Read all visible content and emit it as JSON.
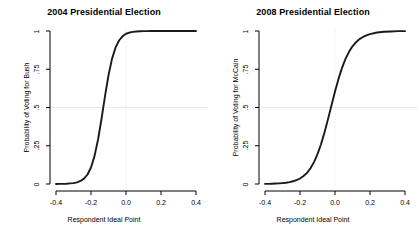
{
  "figure": {
    "width": 417,
    "height": 237,
    "background": "#ffffff",
    "axis_color": "#000000",
    "curve_color": "#1a1a1a",
    "gridline_color": "#e8e8e8"
  },
  "chart_data": [
    {
      "type": "line",
      "title": "2004 Presidential Election",
      "xlabel": "Respondent Ideal Point",
      "ylabel": "Probability of Voting for Bush",
      "xlim": [
        -0.4,
        0.4
      ],
      "ylim": [
        0,
        1
      ],
      "xticks": [
        -0.4,
        -0.2,
        0.0,
        0.2,
        0.4
      ],
      "xtick_labels": [
        "-0.4",
        "-0.2",
        "0.0",
        "0.2",
        "0.4"
      ],
      "yticks": [
        0,
        0.25,
        0.5,
        0.75,
        1
      ],
      "ytick_labels": [
        "0",
        ".25",
        ".5",
        ".75",
        "1"
      ],
      "grid": "reference lines at y=0.5 and x=0.0",
      "reference_lines": {
        "horizontal": 0.5,
        "vertical": 0.0
      },
      "legend": "none",
      "series": [
        {
          "name": "Probability of Voting for Bush",
          "model": "logistic",
          "midpoint": -0.04,
          "slope": 30,
          "x": [
            -0.4,
            -0.38,
            -0.36,
            -0.34,
            -0.32,
            -0.3,
            -0.28,
            -0.26,
            -0.24,
            -0.22,
            -0.2,
            -0.18,
            -0.16,
            -0.14,
            -0.12,
            -0.1,
            -0.08,
            -0.06,
            -0.04,
            -0.02,
            0.0,
            0.02,
            0.04,
            0.06,
            0.08,
            0.1,
            0.12,
            0.14,
            0.16,
            0.18,
            0.2,
            0.24,
            0.28,
            0.32,
            0.36,
            0.4
          ],
          "values": [
            0.0,
            0.001,
            0.001,
            0.002,
            0.004,
            0.006,
            0.011,
            0.02,
            0.035,
            0.062,
            0.108,
            0.182,
            0.289,
            0.425,
            0.574,
            0.711,
            0.818,
            0.891,
            0.938,
            0.965,
            0.982,
            0.99,
            0.994,
            0.997,
            0.998,
            0.999,
            0.999,
            1.0,
            1.0,
            1.0,
            1.0,
            1.0,
            1.0,
            1.0,
            1.0,
            1.0
          ]
        }
      ]
    },
    {
      "type": "line",
      "title": "2008 Presidential Election",
      "xlabel": "Respondent Ideal Point",
      "ylabel": "Probability of Voting for McCain",
      "xlim": [
        -0.4,
        0.4
      ],
      "ylim": [
        0,
        1
      ],
      "xticks": [
        -0.4,
        -0.2,
        0.0,
        0.2,
        0.4
      ],
      "xtick_labels": [
        "-0.4",
        "-0.2",
        "0.0",
        "0.2",
        "0.4"
      ],
      "yticks": [
        0,
        0.25,
        0.5,
        0.75,
        1
      ],
      "ytick_labels": [
        "0",
        ".25",
        ".5",
        ".75",
        "1"
      ],
      "grid": "reference lines at y=0.5 and x=0.0",
      "reference_lines": {
        "horizontal": 0.5,
        "vertical": 0.0
      },
      "legend": "none",
      "series": [
        {
          "name": "Probability of Voting for McCain",
          "model": "logistic",
          "midpoint": -0.012,
          "slope": 19,
          "x": [
            -0.4,
            -0.38,
            -0.36,
            -0.34,
            -0.32,
            -0.3,
            -0.28,
            -0.26,
            -0.24,
            -0.22,
            -0.2,
            -0.18,
            -0.16,
            -0.14,
            -0.12,
            -0.1,
            -0.08,
            -0.06,
            -0.04,
            -0.02,
            0.0,
            0.02,
            0.04,
            0.06,
            0.08,
            0.1,
            0.12,
            0.14,
            0.16,
            0.18,
            0.2,
            0.24,
            0.28,
            0.32,
            0.36,
            0.4
          ],
          "values": [
            0.001,
            0.001,
            0.002,
            0.003,
            0.004,
            0.006,
            0.008,
            0.012,
            0.018,
            0.025,
            0.036,
            0.052,
            0.073,
            0.103,
            0.143,
            0.195,
            0.26,
            0.337,
            0.424,
            0.515,
            0.604,
            0.687,
            0.759,
            0.818,
            0.864,
            0.9,
            0.927,
            0.947,
            0.961,
            0.972,
            0.98,
            0.99,
            0.995,
            0.997,
            0.999,
            0.999
          ]
        }
      ]
    }
  ]
}
